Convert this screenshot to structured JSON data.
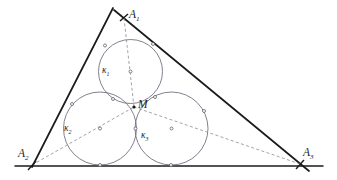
{
  "figure": {
    "background_color": "#ffffff",
    "line_color": "#1b1b1b",
    "circle_color": "#6a6a78",
    "dashed_color": "#8a8a94",
    "point_color": "#2a2a2a",
    "width": 337,
    "height": 180
  },
  "vertices": [
    {
      "id": "A1",
      "name": "A",
      "sub": "1",
      "x": 124,
      "y": 18,
      "label_x": 129,
      "label_y": 9
    },
    {
      "id": "A2",
      "name": "A",
      "sub": "2",
      "x": 32,
      "y": 165,
      "label_x": 18,
      "label_y": 148
    },
    {
      "id": "A3",
      "name": "A",
      "sub": "3",
      "x": 300,
      "y": 164,
      "label_x": 303,
      "label_y": 147
    }
  ],
  "center_point": {
    "id": "M",
    "name": "M",
    "x": 134,
    "y": 107,
    "label_x": 138,
    "label_y": 99
  },
  "circles": [
    {
      "id": "k1",
      "name": "κ",
      "sub": "1",
      "cx": 130.5,
      "cy": 71.5,
      "r": 32.0,
      "label_x": 102,
      "label_y": 66
    },
    {
      "id": "k2",
      "name": "κ",
      "sub": "2",
      "cx": 100.0,
      "cy": 128.5,
      "r": 36.5,
      "label_x": 64,
      "label_y": 124
    },
    {
      "id": "k3",
      "name": "κ",
      "sub": "3",
      "cx": 171.5,
      "cy": 128.5,
      "r": 36.5,
      "label_x": 141,
      "label_y": 131
    }
  ],
  "edges": [
    {
      "id": "left-side",
      "from": "A2",
      "to": "A1",
      "x1": 32,
      "y1": 167,
      "x2": 113,
      "y2": 8
    },
    {
      "id": "right-side",
      "from": "A1",
      "to": "A3",
      "x1": 114,
      "y1": 10,
      "x2": 309,
      "y2": 171
    },
    {
      "id": "base-side",
      "from": "A2",
      "to": "A3",
      "x1": 15,
      "y1": 166,
      "x2": 323,
      "y2": 166
    }
  ],
  "cevians": [
    {
      "id": "cevian-A1-M",
      "from": "A1",
      "to": "M",
      "x1": 124,
      "y1": 18,
      "x2": 134,
      "y2": 107
    },
    {
      "id": "cevian-A2-M",
      "from": "A2",
      "to": "M",
      "x1": 32,
      "y1": 165,
      "x2": 134,
      "y2": 107
    },
    {
      "id": "cevian-A3-M",
      "from": "A3",
      "to": "M",
      "x1": 300,
      "y1": 164,
      "x2": 134,
      "y2": 107
    }
  ],
  "marked_points": [
    {
      "id": "t-k1-left",
      "x": 105,
      "y": 45.5
    },
    {
      "id": "t-k1-right",
      "x": 153,
      "y": 44
    },
    {
      "id": "t-k2-left",
      "x": 72,
      "y": 104
    },
    {
      "id": "t-k2-base",
      "x": 100,
      "y": 165
    },
    {
      "id": "t-k3-right",
      "x": 204,
      "y": 111
    },
    {
      "id": "t-k3-base",
      "x": 171,
      "y": 165
    },
    {
      "id": "t-k1-k2",
      "x": 113,
      "y": 99
    },
    {
      "id": "t-k1-k3",
      "x": 155,
      "y": 97
    },
    {
      "id": "t-k2-k3",
      "x": 135.5,
      "y": 128.5
    },
    {
      "id": "c-k1-center",
      "x": 130.5,
      "y": 71.5
    },
    {
      "id": "c-k2-center",
      "x": 100,
      "y": 128.5
    },
    {
      "id": "c-k3-center",
      "x": 171.5,
      "y": 128.5
    }
  ]
}
